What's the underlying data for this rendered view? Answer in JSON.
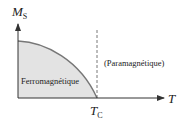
{
  "diagram": {
    "y_axis_label": "M",
    "y_axis_subscript": "S",
    "x_axis_label": "T",
    "critical_label": "T",
    "critical_subscript": "C",
    "region_left": "Ferromagnétique",
    "region_right": "(Paramagnétique)",
    "fill_color": "#e3e3e3",
    "curve_color": "#777777",
    "axis_color": "#333333"
  }
}
